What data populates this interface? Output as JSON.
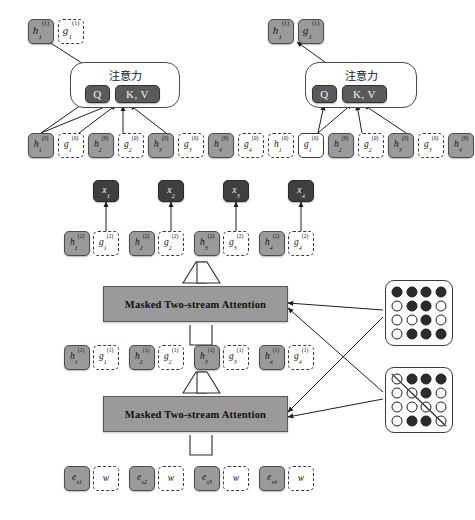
{
  "figure": {
    "title_text": "Two-stream self-attention architecture (XLNet)",
    "attention_label": "注意力",
    "masked_attention_label": "Masked Two-stream Attention",
    "colors": {
      "content_fill": "#9a9a9a",
      "query_fill": "#ffffff",
      "dark_fill": "#3f3f3f",
      "qkv_fill": "#5a5a5a",
      "stroke": "#3a3a3a"
    }
  },
  "content_stream_module": {
    "name": "content-stream-attention",
    "attention_label": "注意力",
    "q_label": "Q",
    "kv_label": "K, V",
    "output": [
      {
        "text": "h",
        "sub": "1",
        "sup": "(1)",
        "style": "solid"
      },
      {
        "text": "g",
        "sub": "1",
        "sup": "(1)",
        "style": "dashed"
      }
    ],
    "inputs": [
      {
        "text": "h",
        "sub": "1",
        "sup": "(0)",
        "style": "solid"
      },
      {
        "text": "g",
        "sub": "1",
        "sup": "(0)",
        "style": "dashed"
      },
      {
        "text": "h",
        "sub": "2",
        "sup": "(0)",
        "style": "solid"
      },
      {
        "text": "g",
        "sub": "2",
        "sup": "(0)",
        "style": "dashed"
      },
      {
        "text": "h",
        "sub": "3",
        "sup": "(0)",
        "style": "solid"
      },
      {
        "text": "g",
        "sub": "3",
        "sup": "(0)",
        "style": "dashed"
      },
      {
        "text": "h",
        "sub": "4",
        "sup": "(0)",
        "style": "solid"
      },
      {
        "text": "g",
        "sub": "4",
        "sup": "(0)",
        "style": "dashed"
      }
    ]
  },
  "query_stream_module": {
    "name": "query-stream-attention",
    "attention_label": "注意力",
    "q_label": "Q",
    "kv_label": "K, V",
    "output": [
      {
        "text": "h",
        "sub": "1",
        "sup": "(1)",
        "style": "solid"
      },
      {
        "text": "g",
        "sub": "1",
        "sup": "(1)",
        "style": "solid"
      }
    ],
    "inputs": [
      {
        "text": "h",
        "sub": "1",
        "sup": "(0)",
        "style": "dashed"
      },
      {
        "text": "g",
        "sub": "1",
        "sup": "(0)",
        "style": "outline"
      },
      {
        "text": "h",
        "sub": "2",
        "sup": "(0)",
        "style": "solid"
      },
      {
        "text": "g",
        "sub": "2",
        "sup": "(0)",
        "style": "dashed"
      },
      {
        "text": "h",
        "sub": "3",
        "sup": "(0)",
        "style": "solid"
      },
      {
        "text": "g",
        "sub": "3",
        "sup": "(0)",
        "style": "dashed"
      },
      {
        "text": "h",
        "sub": "4",
        "sup": "(0)",
        "style": "solid"
      },
      {
        "text": "g",
        "sub": "4",
        "sup": "(0)",
        "style": "dashed"
      }
    ]
  },
  "output_row": {
    "name": "predicted-tokens",
    "tokens": [
      {
        "text": "x",
        "sub": "1",
        "sup": "",
        "style": "dark"
      },
      {
        "text": "x",
        "sub": "2",
        "sup": "",
        "style": "dark"
      },
      {
        "text": "x",
        "sub": "3",
        "sup": "",
        "style": "dark"
      },
      {
        "text": "x",
        "sub": "4",
        "sup": "",
        "style": "dark"
      }
    ]
  },
  "layer2_row": {
    "name": "layer-2-states",
    "pairs": [
      [
        {
          "text": "h",
          "sub": "1",
          "sup": "(2)",
          "style": "solid"
        },
        {
          "text": "g",
          "sub": "1",
          "sup": "(2)",
          "style": "dashed"
        }
      ],
      [
        {
          "text": "h",
          "sub": "2",
          "sup": "(2)",
          "style": "solid"
        },
        {
          "text": "g",
          "sub": "2",
          "sup": "(2)",
          "style": "dashed"
        }
      ],
      [
        {
          "text": "h",
          "sub": "3",
          "sup": "(2)",
          "style": "solid"
        },
        {
          "text": "g",
          "sub": "3",
          "sup": "(2)",
          "style": "dashed"
        }
      ],
      [
        {
          "text": "h",
          "sub": "4",
          "sup": "(2)",
          "style": "solid"
        },
        {
          "text": "g",
          "sub": "4",
          "sup": "(2)",
          "style": "dashed"
        }
      ]
    ]
  },
  "layer1_row": {
    "name": "layer-1-states",
    "pairs": [
      [
        {
          "text": "h",
          "sub": "1",
          "sup": "(1)",
          "style": "solid"
        },
        {
          "text": "g",
          "sub": "1",
          "sup": "(1)",
          "style": "dashed"
        }
      ],
      [
        {
          "text": "h",
          "sub": "2",
          "sup": "(1)",
          "style": "solid"
        },
        {
          "text": "g",
          "sub": "2",
          "sup": "(1)",
          "style": "dashed"
        }
      ],
      [
        {
          "text": "h",
          "sub": "3",
          "sup": "(1)",
          "style": "solid"
        },
        {
          "text": "g",
          "sub": "3",
          "sup": "(1)",
          "style": "dashed"
        }
      ],
      [
        {
          "text": "h",
          "sub": "4",
          "sup": "(1)",
          "style": "solid"
        },
        {
          "text": "g",
          "sub": "4",
          "sup": "(1)",
          "style": "dashed"
        }
      ]
    ]
  },
  "embedding_row": {
    "name": "input-embeddings",
    "pairs": [
      [
        {
          "text": "e",
          "sub": "x1",
          "sup": "",
          "style": "solid"
        },
        {
          "text": "w",
          "sub": "",
          "sup": "",
          "style": "dashed"
        }
      ],
      [
        {
          "text": "e",
          "sub": "x2",
          "sup": "",
          "style": "solid"
        },
        {
          "text": "w",
          "sub": "",
          "sup": "",
          "style": "dashed"
        }
      ],
      [
        {
          "text": "e",
          "sub": "x3",
          "sup": "",
          "style": "solid"
        },
        {
          "text": "w",
          "sub": "",
          "sup": "",
          "style": "dashed"
        }
      ],
      [
        {
          "text": "e",
          "sub": "x4",
          "sup": "",
          "style": "solid"
        },
        {
          "text": "w",
          "sub": "",
          "sup": "",
          "style": "dashed"
        }
      ]
    ]
  },
  "masked_layers": [
    {
      "name": "masked-two-stream-attention-upper",
      "label": "Masked Two-stream Attention"
    },
    {
      "name": "masked-two-stream-attention-lower",
      "label": "Masked Two-stream Attention"
    }
  ],
  "mask_grids": [
    {
      "name": "content-stream-mask",
      "caption": "",
      "diagonal": false,
      "rows": [
        [
          1,
          1,
          1,
          1
        ],
        [
          0,
          1,
          1,
          0
        ],
        [
          0,
          0,
          1,
          0
        ],
        [
          0,
          1,
          1,
          1
        ]
      ]
    },
    {
      "name": "query-stream-mask",
      "caption": "",
      "diagonal": true,
      "rows": [
        [
          0,
          1,
          1,
          1
        ],
        [
          0,
          0,
          1,
          0
        ],
        [
          0,
          0,
          0,
          0
        ],
        [
          0,
          1,
          1,
          0
        ]
      ]
    }
  ]
}
